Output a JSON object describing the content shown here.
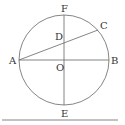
{
  "diagram": {
    "type": "geometry-circle",
    "colors": {
      "stroke": "#666666",
      "text": "#333333",
      "background": "#ffffff"
    },
    "circle": {
      "center": "O",
      "cx": 64,
      "cy": 60,
      "r": 45
    },
    "points": {
      "A": {
        "label": "A",
        "x": 19,
        "y": 60
      },
      "B": {
        "label": "B",
        "x": 109,
        "y": 60
      },
      "C": {
        "label": "C",
        "x": 98,
        "y": 30
      },
      "D": {
        "label": "D",
        "x": 64,
        "y": 43
      },
      "E": {
        "label": "E",
        "x": 64,
        "y": 105
      },
      "F": {
        "label": "F",
        "x": 64,
        "y": 15
      },
      "O": {
        "label": "O",
        "x": 64,
        "y": 60
      }
    },
    "segments": [
      "AB",
      "FE",
      "AC"
    ],
    "baseline": {
      "x1": 2,
      "y1": 120,
      "x2": 118,
      "y2": 120
    }
  }
}
